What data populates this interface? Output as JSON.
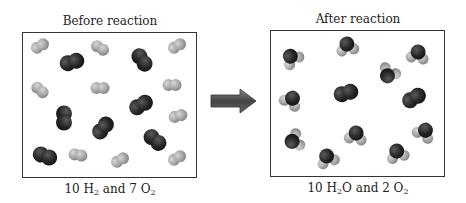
{
  "before": {
    "title": "Before reaction",
    "caption_parts": [
      "10 H",
      "2",
      " and 7 O",
      "2"
    ],
    "h2_count": 10,
    "o2_count": 7
  },
  "after": {
    "title": "After reaction",
    "caption_parts": [
      "10 H",
      "2",
      "O and 2 O",
      "2"
    ],
    "h2o_count": 10,
    "o2_count": 2
  },
  "arrow": {
    "direction": "right",
    "color": "#555555"
  },
  "colors": {
    "hydrogen": "#a8a8a8",
    "oxygen": "#2a2a2a",
    "border": "#333333"
  },
  "molecules_before": [
    {
      "type": "H2",
      "x": 40,
      "y": 46,
      "angle": -30
    },
    {
      "type": "O2",
      "x": 72,
      "y": 62,
      "angle": -15
    },
    {
      "type": "H2",
      "x": 100,
      "y": 48,
      "angle": 30
    },
    {
      "type": "O2",
      "x": 142,
      "y": 60,
      "angle": 55
    },
    {
      "type": "H2",
      "x": 177,
      "y": 46,
      "angle": -30
    },
    {
      "type": "H2",
      "x": 40,
      "y": 90,
      "angle": 40
    },
    {
      "type": "H2",
      "x": 100,
      "y": 88,
      "angle": 0
    },
    {
      "type": "O2",
      "x": 141,
      "y": 105,
      "angle": -30
    },
    {
      "type": "H2",
      "x": 172,
      "y": 85,
      "angle": 0
    },
    {
      "type": "O2",
      "x": 64,
      "y": 118,
      "angle": 90
    },
    {
      "type": "O2",
      "x": 103,
      "y": 128,
      "angle": -50
    },
    {
      "type": "H2",
      "x": 178,
      "y": 116,
      "angle": -15
    },
    {
      "type": "O2",
      "x": 155,
      "y": 140,
      "angle": 40
    },
    {
      "type": "O2",
      "x": 45,
      "y": 156,
      "angle": 20
    },
    {
      "type": "H2",
      "x": 78,
      "y": 155,
      "angle": 10
    },
    {
      "type": "H2",
      "x": 120,
      "y": 160,
      "angle": -30
    },
    {
      "type": "H2",
      "x": 177,
      "y": 158,
      "angle": -30
    }
  ],
  "molecules_after": [
    {
      "type": "H2O",
      "x": 291,
      "y": 57,
      "angle": -40
    },
    {
      "type": "H2O",
      "x": 347,
      "y": 45,
      "angle": -10
    },
    {
      "type": "H2O",
      "x": 418,
      "y": 53,
      "angle": 10
    },
    {
      "type": "H2O",
      "x": 388,
      "y": 75,
      "angle": -150
    },
    {
      "type": "H2O",
      "x": 292,
      "y": 99,
      "angle": 30
    },
    {
      "type": "O2",
      "x": 346,
      "y": 93,
      "angle": -15
    },
    {
      "type": "O2",
      "x": 414,
      "y": 98,
      "angle": -30
    },
    {
      "type": "H2O",
      "x": 293,
      "y": 141,
      "angle": -110
    },
    {
      "type": "H2O",
      "x": 356,
      "y": 134,
      "angle": 10
    },
    {
      "type": "H2O",
      "x": 425,
      "y": 131,
      "angle": 30
    },
    {
      "type": "H2O",
      "x": 327,
      "y": 157,
      "angle": -20
    },
    {
      "type": "H2O",
      "x": 397,
      "y": 152,
      "angle": -15
    }
  ]
}
